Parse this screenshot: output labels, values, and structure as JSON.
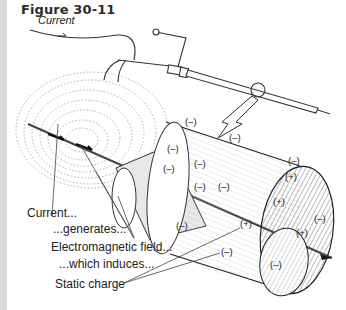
{
  "figure": {
    "title": "Figure 30-11",
    "current_wire_label": "Current"
  },
  "labels": {
    "current": "Current...",
    "generates": "...generates...",
    "em_field": "Electromagnetic field...",
    "induces": "...which induces...",
    "static_charge": "Static charge"
  },
  "charges": {
    "negative": "(–)",
    "positive": "(+)"
  },
  "colors": {
    "side_bar": "#d9d9d9",
    "ink": "#222222",
    "field_lines": "#9a9a9a"
  }
}
